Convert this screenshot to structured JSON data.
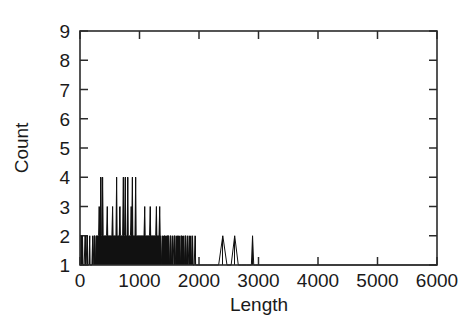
{
  "figure": {
    "background_color": "#ffffff",
    "line_color": "#111111",
    "axis_color": "#2b2b2b",
    "text_color": "#1a1a1a"
  },
  "axes": {
    "x_title": "Length",
    "y_title": "Count",
    "x_tick_labels": [
      "0",
      "1000",
      "2000",
      "3000",
      "4000",
      "5000",
      "6000"
    ],
    "y_tick_labels": [
      "1",
      "2",
      "3",
      "4",
      "5",
      "6",
      "7",
      "8",
      "9"
    ]
  },
  "chart_data": {
    "type": "line",
    "title": "",
    "xlabel": "Length",
    "ylabel": "Count",
    "xlim": [
      0,
      6000
    ],
    "ylim": [
      1,
      9
    ],
    "xticks": [
      0,
      1000,
      2000,
      3000,
      4000,
      5000,
      6000
    ],
    "yticks": [
      1,
      2,
      3,
      4,
      5,
      6,
      7,
      8,
      9
    ],
    "grid": false,
    "legend": "none",
    "style": "impulse-histogram",
    "series": [
      {
        "name": "Count vs Length",
        "points": [
          [
            0,
            1
          ],
          [
            10,
            1
          ],
          [
            18,
            2
          ],
          [
            24,
            1
          ],
          [
            34,
            1
          ],
          [
            42,
            2
          ],
          [
            50,
            1
          ],
          [
            60,
            1
          ],
          [
            70,
            1
          ],
          [
            86,
            2
          ],
          [
            92,
            1
          ],
          [
            104,
            1
          ],
          [
            118,
            2
          ],
          [
            124,
            1
          ],
          [
            140,
            1
          ],
          [
            150,
            1
          ],
          [
            164,
            2
          ],
          [
            170,
            1
          ],
          [
            186,
            1
          ],
          [
            200,
            1
          ],
          [
            214,
            2
          ],
          [
            222,
            1
          ],
          [
            236,
            2
          ],
          [
            244,
            2
          ],
          [
            252,
            2
          ],
          [
            262,
            1
          ],
          [
            274,
            2
          ],
          [
            284,
            2
          ],
          [
            292,
            2
          ],
          [
            300,
            2
          ],
          [
            312,
            2
          ],
          [
            322,
            3
          ],
          [
            330,
            2
          ],
          [
            340,
            2
          ],
          [
            352,
            4
          ],
          [
            360,
            2
          ],
          [
            370,
            2
          ],
          [
            380,
            4
          ],
          [
            390,
            2
          ],
          [
            400,
            2
          ],
          [
            412,
            2
          ],
          [
            422,
            2
          ],
          [
            434,
            2
          ],
          [
            446,
            2
          ],
          [
            458,
            3
          ],
          [
            466,
            2
          ],
          [
            478,
            2
          ],
          [
            490,
            2
          ],
          [
            502,
            2
          ],
          [
            514,
            2
          ],
          [
            524,
            2
          ],
          [
            536,
            2
          ],
          [
            548,
            3
          ],
          [
            556,
            2
          ],
          [
            568,
            2
          ],
          [
            580,
            2
          ],
          [
            592,
            2
          ],
          [
            604,
            2
          ],
          [
            616,
            4
          ],
          [
            624,
            2
          ],
          [
            636,
            2
          ],
          [
            648,
            2
          ],
          [
            660,
            2
          ],
          [
            672,
            3
          ],
          [
            680,
            2
          ],
          [
            692,
            2
          ],
          [
            704,
            2
          ],
          [
            716,
            2
          ],
          [
            728,
            4
          ],
          [
            736,
            2
          ],
          [
            748,
            2
          ],
          [
            760,
            4
          ],
          [
            768,
            2
          ],
          [
            780,
            2
          ],
          [
            792,
            2
          ],
          [
            804,
            4
          ],
          [
            812,
            2
          ],
          [
            824,
            2
          ],
          [
            836,
            2
          ],
          [
            848,
            2
          ],
          [
            860,
            3
          ],
          [
            868,
            2
          ],
          [
            880,
            4
          ],
          [
            888,
            2
          ],
          [
            900,
            2
          ],
          [
            912,
            2
          ],
          [
            924,
            2
          ],
          [
            936,
            4
          ],
          [
            944,
            2
          ],
          [
            956,
            2
          ],
          [
            968,
            2
          ],
          [
            980,
            2
          ],
          [
            992,
            2
          ],
          [
            1004,
            2
          ],
          [
            1016,
            2
          ],
          [
            1028,
            2
          ],
          [
            1040,
            2
          ],
          [
            1052,
            2
          ],
          [
            1064,
            2
          ],
          [
            1076,
            2
          ],
          [
            1088,
            3
          ],
          [
            1096,
            2
          ],
          [
            1108,
            2
          ],
          [
            1120,
            2
          ],
          [
            1132,
            2
          ],
          [
            1144,
            2
          ],
          [
            1156,
            2
          ],
          [
            1168,
            2
          ],
          [
            1180,
            3
          ],
          [
            1188,
            2
          ],
          [
            1200,
            2
          ],
          [
            1212,
            2
          ],
          [
            1224,
            2
          ],
          [
            1236,
            2
          ],
          [
            1248,
            2
          ],
          [
            1260,
            2
          ],
          [
            1272,
            2
          ],
          [
            1284,
            3
          ],
          [
            1292,
            2
          ],
          [
            1304,
            2
          ],
          [
            1316,
            2
          ],
          [
            1328,
            2
          ],
          [
            1340,
            3
          ],
          [
            1348,
            2
          ],
          [
            1360,
            2
          ],
          [
            1372,
            1
          ],
          [
            1386,
            2
          ],
          [
            1394,
            1
          ],
          [
            1410,
            2
          ],
          [
            1420,
            2
          ],
          [
            1432,
            2
          ],
          [
            1444,
            1
          ],
          [
            1458,
            2
          ],
          [
            1468,
            2
          ],
          [
            1480,
            2
          ],
          [
            1492,
            2
          ],
          [
            1504,
            1
          ],
          [
            1518,
            2
          ],
          [
            1528,
            2
          ],
          [
            1540,
            1
          ],
          [
            1554,
            2
          ],
          [
            1564,
            1
          ],
          [
            1580,
            2
          ],
          [
            1590,
            2
          ],
          [
            1602,
            1
          ],
          [
            1616,
            2
          ],
          [
            1626,
            1
          ],
          [
            1642,
            2
          ],
          [
            1652,
            2
          ],
          [
            1664,
            1
          ],
          [
            1680,
            2
          ],
          [
            1690,
            1
          ],
          [
            1706,
            2
          ],
          [
            1716,
            2
          ],
          [
            1728,
            1
          ],
          [
            1744,
            2
          ],
          [
            1754,
            1
          ],
          [
            1770,
            2
          ],
          [
            1780,
            2
          ],
          [
            1792,
            1
          ],
          [
            1808,
            2
          ],
          [
            1818,
            1
          ],
          [
            1836,
            2
          ],
          [
            1846,
            1
          ],
          [
            1864,
            2
          ],
          [
            1874,
            1
          ],
          [
            1892,
            2
          ],
          [
            1902,
            1
          ],
          [
            1920,
            1
          ],
          [
            1934,
            2
          ],
          [
            1944,
            1
          ],
          [
            1960,
            1
          ],
          [
            1990,
            1
          ],
          [
            2050,
            1
          ],
          [
            2150,
            1
          ],
          [
            2250,
            1
          ],
          [
            2330,
            1
          ],
          [
            2400,
            2
          ],
          [
            2470,
            1
          ],
          [
            2540,
            1
          ],
          [
            2600,
            2
          ],
          [
            2660,
            1
          ],
          [
            2720,
            1
          ],
          [
            2800,
            1
          ],
          [
            2880,
            1
          ],
          [
            2900,
            2
          ],
          [
            2920,
            1
          ],
          [
            2950,
            1
          ],
          [
            3000,
            1
          ],
          [
            6000,
            1
          ]
        ]
      }
    ]
  }
}
